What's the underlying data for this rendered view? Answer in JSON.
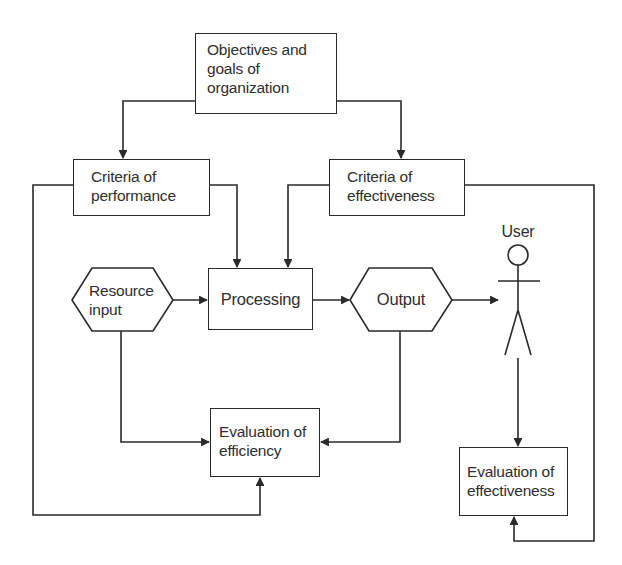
{
  "diagram": {
    "type": "flowchart",
    "nodes": {
      "objectives": {
        "label": "Objectives and goals of organization",
        "lines": [
          "Objectives and",
          "goals of",
          "organization"
        ],
        "shape": "rectangle"
      },
      "criteria_performance": {
        "label": "Criteria of performance",
        "lines": [
          "Criteria of",
          "performance"
        ],
        "shape": "rectangle"
      },
      "criteria_effectiveness": {
        "label": "Criteria of effectiveness",
        "lines": [
          "Criteria of",
          "effectiveness"
        ],
        "shape": "rectangle"
      },
      "resource_input": {
        "label": "Resource input",
        "lines": [
          "Resource",
          "input"
        ],
        "shape": "hexagon"
      },
      "processing": {
        "label": "Processing",
        "shape": "rectangle"
      },
      "output": {
        "label": "Output",
        "shape": "hexagon"
      },
      "user": {
        "label": "User",
        "shape": "stick-figure"
      },
      "eval_efficiency": {
        "label": "Evaluation of efficiency",
        "lines": [
          "Evaluation of",
          "efficiency"
        ],
        "shape": "rectangle"
      },
      "eval_effectiveness": {
        "label": "Evaluation of effectiveness",
        "lines": [
          "Evaluation of",
          "effectiveness"
        ],
        "shape": "rectangle"
      }
    },
    "edges": [
      {
        "from": "objectives",
        "to": "criteria_performance"
      },
      {
        "from": "objectives",
        "to": "criteria_effectiveness"
      },
      {
        "from": "criteria_performance",
        "to": "processing"
      },
      {
        "from": "criteria_effectiveness",
        "to": "processing"
      },
      {
        "from": "resource_input",
        "to": "processing"
      },
      {
        "from": "processing",
        "to": "output"
      },
      {
        "from": "output",
        "to": "user"
      },
      {
        "from": "resource_input",
        "to": "eval_efficiency"
      },
      {
        "from": "output",
        "to": "eval_efficiency"
      },
      {
        "from": "criteria_performance",
        "to": "eval_efficiency"
      },
      {
        "from": "user",
        "to": "eval_effectiveness"
      },
      {
        "from": "criteria_effectiveness",
        "to": "eval_effectiveness"
      }
    ],
    "line_color": "#2a2a2a"
  }
}
